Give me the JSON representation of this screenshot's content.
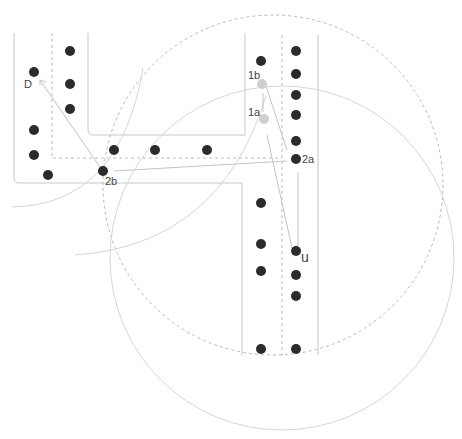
{
  "title": "",
  "colors": {
    "vehicle": "#2b2b2b",
    "highlight": "#cfcfcf",
    "road_edge": "#c8c8c8",
    "lane_divider": "#bdbdbd",
    "range_solid": "#d6d6d6",
    "range_dashed": "#b8b8b8",
    "arrow": "#c4c4c4",
    "label": "#444444"
  },
  "labels": {
    "destination": "D",
    "user": "u",
    "node_1a": "1a",
    "node_1b": "1b",
    "node_2a": "2a",
    "node_2b": "2b"
  },
  "legend": {
    "vehicle_icon": "filled-circle",
    "candidate_icon": "grey-circle",
    "range_icon": "circle-arc"
  }
}
